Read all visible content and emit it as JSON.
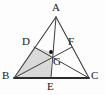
{
  "figure": {
    "kind": "geometry-diagram",
    "background_color": "#fdfdfd",
    "stroke_color": "#3d3d3d",
    "thick_stroke_color": "#2b2b2b",
    "shade_color": "#d9d9d9",
    "point_color": "#111111",
    "canvas": {
      "width": 105,
      "height": 95
    }
  },
  "points": {
    "A": {
      "label": "A",
      "x": 56,
      "y": 17,
      "label_x": 52,
      "label_y": 2
    },
    "B": {
      "label": "B",
      "x": 14,
      "y": 78,
      "label_x": 2,
      "label_y": 70
    },
    "C": {
      "label": "C",
      "x": 89,
      "y": 78,
      "label_x": 91,
      "label_y": 70
    },
    "D": {
      "label": "D",
      "x": 34,
      "y": 47,
      "label_x": 22,
      "label_y": 36
    },
    "E": {
      "label": "E",
      "x": 51,
      "y": 78,
      "label_x": 47,
      "label_y": 81
    },
    "F": {
      "label": "F",
      "x": 72,
      "y": 47,
      "label_x": 68,
      "label_y": 36
    },
    "G": {
      "label": "G",
      "x": 51,
      "y": 52,
      "label_x": 53,
      "label_y": 56
    }
  },
  "segments": [
    {
      "name": "side-AB",
      "from": "A",
      "to": "B",
      "weight": 1.1
    },
    {
      "name": "side-AC",
      "from": "A",
      "to": "C",
      "weight": 1.1
    },
    {
      "name": "side-BC",
      "from": "B",
      "to": "C",
      "weight": 1.8
    },
    {
      "name": "median-AE",
      "from": "A",
      "to": "E",
      "weight": 1.0
    },
    {
      "name": "median-BF",
      "from": "B",
      "to": "F",
      "weight": 1.0
    },
    {
      "name": "median-CD",
      "from": "C",
      "to": "D",
      "weight": 1.0
    }
  ],
  "shaded_regions": [
    {
      "name": "quadrilateral-BDGE",
      "vertices": [
        "B",
        "D",
        "G",
        "E"
      ]
    }
  ],
  "marked_points": [
    "G"
  ],
  "vertex_labels": [
    "A",
    "B",
    "C",
    "D",
    "E",
    "F",
    "G"
  ]
}
